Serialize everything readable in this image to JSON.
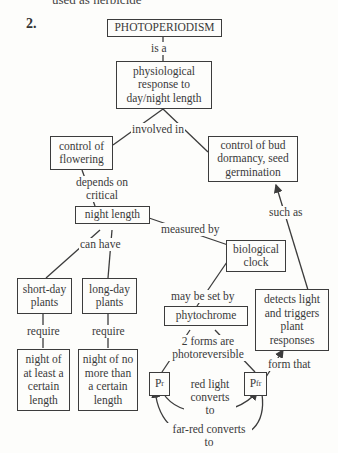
{
  "header": {
    "clipped_text": "used as herbicide",
    "question_number": "2."
  },
  "concepts": {
    "photoperiodism": "PHOTOPERIODISM",
    "physiological_response": "physiological response to day/night length",
    "control_flowering": "control of flowering",
    "control_dormancy": "control of bud dormancy, seed germination",
    "night_length": "night length",
    "biological_clock": "biological clock",
    "short_day": "short-day plants",
    "long_day": "long-day plants",
    "phytochrome": "phytochrome",
    "detects_light": "detects light and triggers plant responses",
    "night_at_least": "night of at least a certain length",
    "night_no_more": "night of no more than a certain length",
    "pr_base": "P",
    "pr_sub": "r",
    "pfr_base": "P",
    "pfr_sub": "fr"
  },
  "links": {
    "is_a": "is a",
    "involved_in": "involved in",
    "depends_on": "depends on critical",
    "such_as": "such as",
    "measured_by": "measured by",
    "can_have": "can have",
    "may_be_set_by": "may be set by",
    "require_1": "require",
    "require_2": "require",
    "two_forms": "2 forms are photoreversible",
    "form_that": "form that",
    "red_light": "red light converts to",
    "far_red": "far-red converts to"
  },
  "colors": {
    "line": "#3c3c3c",
    "text": "#3a3a3a",
    "background": "#fdfdfb"
  }
}
